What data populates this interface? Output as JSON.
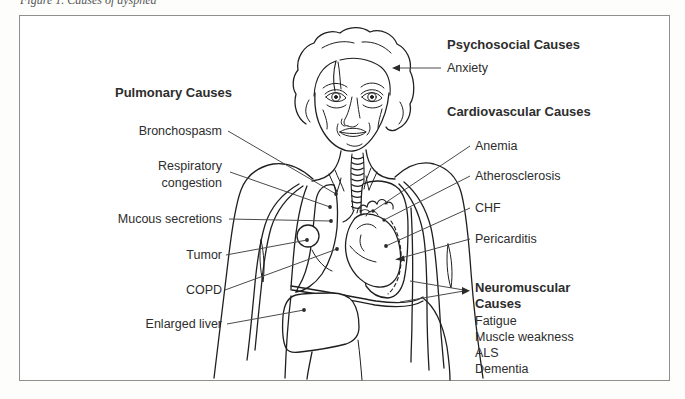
{
  "caption": "Figure 1. Causes of dyspnea",
  "diagram": {
    "pulmonary": {
      "header": "Pulmonary Causes",
      "bronchospasm": "Bronchospasm",
      "respiratory_line1": "Respiratory",
      "respiratory_line2": "congestion",
      "mucous_secretions": "Mucous secretions",
      "tumor": "Tumor",
      "copd": "COPD",
      "enlarged_liver": "Enlarged liver"
    },
    "psychosocial": {
      "header": "Psychosocial Causes",
      "anxiety": "Anxiety"
    },
    "cardiovascular": {
      "header": "Cardiovascular Causes",
      "anemia": "Anemia",
      "atherosclerosis": "Atherosclerosis",
      "chf": "CHF",
      "pericarditis": "Pericarditis"
    },
    "neuromuscular": {
      "header_line1": "Neuromuscular",
      "header_line2": "Causes",
      "fatigue": "Fatigue",
      "muscle_weakness": "Muscle weakness",
      "als": "ALS",
      "dementia": "Dementia"
    }
  },
  "colors": {
    "outline": "#1f1f1f",
    "leader": "#4a4a4a",
    "text": "#2d2d2d",
    "frame_border": "#8f8f8f",
    "background": "#ffffff"
  }
}
